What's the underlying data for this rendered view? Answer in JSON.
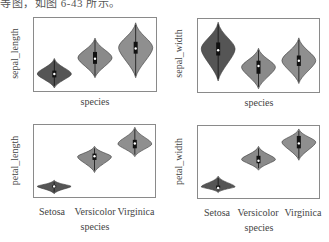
{
  "caption": "等图，如图 6-43 所示。",
  "colors": {
    "setosa": "#555555",
    "versicolor": "#8a8a8a",
    "virginica": "#8f8f8f",
    "frame": "#8a8a8a",
    "inner": "#111111"
  },
  "chart_data": [
    {
      "type": "violin",
      "ylabel": "sepal_length",
      "xlabel": "species",
      "categories": [
        "Setosa",
        "Versicolor",
        "Virginica"
      ],
      "show_tick_labels": false,
      "series": [
        {
          "name": "Setosa",
          "min": 4.3,
          "q1": 4.8,
          "median": 5.0,
          "q3": 5.2,
          "max": 5.8
        },
        {
          "name": "Versicolor",
          "min": 4.9,
          "q1": 5.6,
          "median": 5.9,
          "q3": 6.3,
          "max": 7.0
        },
        {
          "name": "Virginica",
          "min": 4.9,
          "q1": 6.2,
          "median": 6.5,
          "q3": 6.9,
          "max": 7.9
        }
      ],
      "ylim": [
        4.0,
        8.3
      ]
    },
    {
      "type": "violin",
      "ylabel": "sepal_width",
      "xlabel": "species",
      "categories": [
        "Setosa",
        "Versicolor",
        "Virginica"
      ],
      "show_tick_labels": false,
      "series": [
        {
          "name": "Setosa",
          "min": 2.3,
          "q1": 3.2,
          "median": 3.4,
          "q3": 3.7,
          "max": 4.4
        },
        {
          "name": "Versicolor",
          "min": 2.0,
          "q1": 2.5,
          "median": 2.8,
          "q3": 3.0,
          "max": 3.4
        },
        {
          "name": "Virginica",
          "min": 2.2,
          "q1": 2.8,
          "median": 3.0,
          "q3": 3.2,
          "max": 3.8
        }
      ],
      "ylim": [
        1.8,
        4.6
      ]
    },
    {
      "type": "violin",
      "ylabel": "petal_length",
      "xlabel": "species",
      "categories": [
        "Setosa",
        "Versicolor",
        "Virginica"
      ],
      "show_tick_labels": true,
      "series": [
        {
          "name": "Setosa",
          "min": 1.0,
          "q1": 1.4,
          "median": 1.5,
          "q3": 1.6,
          "max": 1.9
        },
        {
          "name": "Versicolor",
          "min": 3.0,
          "q1": 4.0,
          "median": 4.35,
          "q3": 4.6,
          "max": 5.1
        },
        {
          "name": "Virginica",
          "min": 4.5,
          "q1": 5.1,
          "median": 5.55,
          "q3": 5.9,
          "max": 6.9
        }
      ],
      "ylim": [
        0.5,
        7.3
      ]
    },
    {
      "type": "violin",
      "ylabel": "petal_width",
      "xlabel": "species",
      "categories": [
        "Setosa",
        "Versicolor",
        "Virginica"
      ],
      "show_tick_labels": true,
      "series": [
        {
          "name": "Setosa",
          "min": 0.1,
          "q1": 0.2,
          "median": 0.2,
          "q3": 0.3,
          "max": 0.6
        },
        {
          "name": "Versicolor",
          "min": 1.0,
          "q1": 1.2,
          "median": 1.3,
          "q3": 1.5,
          "max": 1.8
        },
        {
          "name": "Virginica",
          "min": 1.4,
          "q1": 1.8,
          "median": 2.0,
          "q3": 2.3,
          "max": 2.5
        }
      ],
      "ylim": [
        -0.2,
        2.7
      ]
    }
  ]
}
